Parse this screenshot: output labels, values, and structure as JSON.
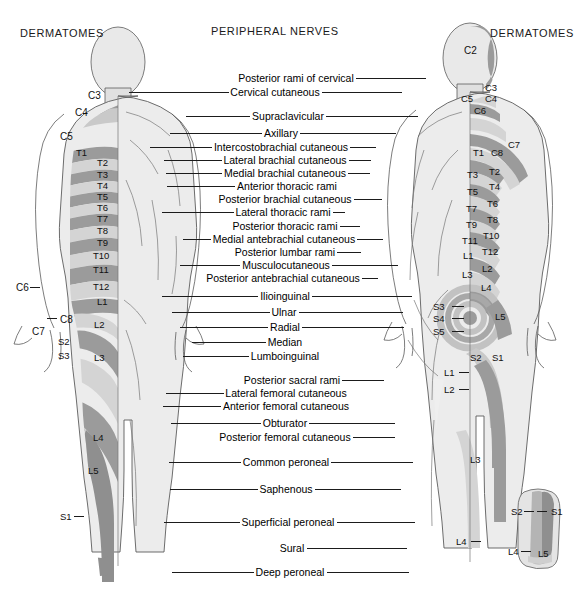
{
  "headers": {
    "left": "DERMATOMES",
    "center": "PERIPHERAL NERVES",
    "right": "DERMATOMES"
  },
  "nerve_labels": [
    {
      "text": "Posterior rami of cervical",
      "x": 296,
      "y": 78,
      "l": 0,
      "r": 70
    },
    {
      "text": "Cervical cutaneous",
      "x": 275,
      "y": 92,
      "l": 100,
      "r": 80
    },
    {
      "text": "Supraclavicular",
      "x": 288,
      "y": 116,
      "l": 64,
      "r": 92
    },
    {
      "text": "Axillary",
      "x": 281,
      "y": 133,
      "l": 92,
      "r": 96
    },
    {
      "text": "Intercostobrachial cutaneous",
      "x": 281,
      "y": 147,
      "l": 62,
      "r": 26
    },
    {
      "text": "Lateral brachial cutaneous",
      "x": 285,
      "y": 160,
      "l": 58,
      "r": 22
    },
    {
      "text": "Medial brachial cutaneous",
      "x": 285,
      "y": 173,
      "l": 56,
      "r": 22
    },
    {
      "text": "Anterior thoracic rami",
      "x": 287,
      "y": 186,
      "l": 68,
      "r": 0
    },
    {
      "text": "Posterior brachial cutaneous",
      "x": 285,
      "y": 199,
      "l": 0,
      "r": 28
    },
    {
      "text": "Lateral thoracic rami",
      "x": 283,
      "y": 212,
      "l": 72,
      "r": 12
    },
    {
      "text": "Posterior thoracic rami",
      "x": 285,
      "y": 226,
      "l": 0,
      "r": 20
    },
    {
      "text": "Medial antebrachial cutaneous",
      "x": 284,
      "y": 239,
      "l": 28,
      "r": 26
    },
    {
      "text": "Posterior lumbar rami",
      "x": 285,
      "y": 252,
      "l": 0,
      "r": 24
    },
    {
      "text": "Musculocutaneous",
      "x": 286,
      "y": 265,
      "l": 60,
      "r": 66
    },
    {
      "text": "Posterior antebrachial cutaneous",
      "x": 283,
      "y": 278,
      "l": 0,
      "r": 16
    },
    {
      "text": "Ilioinguinal",
      "x": 285,
      "y": 296,
      "l": 96,
      "r": 100
    },
    {
      "text": "Ulnar",
      "x": 284,
      "y": 312,
      "l": 98,
      "r": 104
    },
    {
      "text": "Radial",
      "x": 285,
      "y": 327,
      "l": 88,
      "r": 102
    },
    {
      "text": "Median",
      "x": 285,
      "y": 342,
      "l": 74,
      "r": 0
    },
    {
      "text": "Lumboinguinal",
      "x": 285,
      "y": 356,
      "l": 66,
      "r": 0
    },
    {
      "text": "Posterior sacral rami",
      "x": 292,
      "y": 380,
      "l": 0,
      "r": 42
    },
    {
      "text": "Lateral femoral cutaneous",
      "x": 286,
      "y": 393,
      "l": 58,
      "r": 0
    },
    {
      "text": "Anterior femoral cutaneous",
      "x": 286,
      "y": 406,
      "l": 58,
      "r": 0
    },
    {
      "text": "Obturator",
      "x": 285,
      "y": 423,
      "l": 90,
      "r": 86
    },
    {
      "text": "Posterior femoral cutaneous",
      "x": 285,
      "y": 437,
      "l": 0,
      "r": 42
    },
    {
      "text": "Common peroneal",
      "x": 286,
      "y": 462,
      "l": 72,
      "r": 82
    },
    {
      "text": "Saphenous",
      "x": 286,
      "y": 489,
      "l": 88,
      "r": 86
    },
    {
      "text": "Superficial peroneal",
      "x": 288,
      "y": 522,
      "l": 76,
      "r": 78
    },
    {
      "text": "Sural",
      "x": 292,
      "y": 548,
      "l": 0,
      "r": 100
    },
    {
      "text": "Deep peroneal",
      "x": 290,
      "y": 572,
      "l": 82,
      "r": 82
    }
  ],
  "dermatomes_anterior": [
    {
      "text": "C3",
      "x": 88,
      "y": 91,
      "big": true
    },
    {
      "text": "C4",
      "x": 75,
      "y": 108,
      "big": true
    },
    {
      "text": "C5",
      "x": 60,
      "y": 132,
      "big": true
    },
    {
      "text": "T1",
      "x": 76,
      "y": 148
    },
    {
      "text": "T2",
      "x": 97,
      "y": 158
    },
    {
      "text": "T3",
      "x": 97,
      "y": 170
    },
    {
      "text": "T4",
      "x": 97,
      "y": 181
    },
    {
      "text": "T5",
      "x": 97,
      "y": 192
    },
    {
      "text": "T6",
      "x": 97,
      "y": 203
    },
    {
      "text": "T7",
      "x": 97,
      "y": 214
    },
    {
      "text": "T8",
      "x": 97,
      "y": 226
    },
    {
      "text": "T9",
      "x": 97,
      "y": 238
    },
    {
      "text": "T10",
      "x": 93,
      "y": 251
    },
    {
      "text": "T11",
      "x": 93,
      "y": 265
    },
    {
      "text": "T12",
      "x": 93,
      "y": 282
    },
    {
      "text": "C6",
      "x": 16,
      "y": 283,
      "big": true
    },
    {
      "text": "L1",
      "x": 97,
      "y": 297
    },
    {
      "text": "C7",
      "x": 32,
      "y": 327,
      "big": true
    },
    {
      "text": "C8",
      "x": 60,
      "y": 315,
      "big": true
    },
    {
      "text": "L2",
      "x": 94,
      "y": 320
    },
    {
      "text": "S2",
      "x": 58,
      "y": 337
    },
    {
      "text": "S3",
      "x": 58,
      "y": 351
    },
    {
      "text": "L3",
      "x": 94,
      "y": 353
    },
    {
      "text": "L4",
      "x": 93,
      "y": 433
    },
    {
      "text": "L5",
      "x": 88,
      "y": 466
    },
    {
      "text": "S1",
      "x": 60,
      "y": 512
    }
  ],
  "dermatomes_posterior": [
    {
      "text": "C2",
      "x": 464,
      "y": 46,
      "big": true
    },
    {
      "text": "C3",
      "x": 485,
      "y": 83
    },
    {
      "text": "C4",
      "x": 485,
      "y": 94
    },
    {
      "text": "C5",
      "x": 461,
      "y": 94
    },
    {
      "text": "C6",
      "x": 474,
      "y": 106
    },
    {
      "text": "C7",
      "x": 508,
      "y": 140
    },
    {
      "text": "C8",
      "x": 491,
      "y": 148
    },
    {
      "text": "T1",
      "x": 473,
      "y": 148
    },
    {
      "text": "T2",
      "x": 489,
      "y": 167
    },
    {
      "text": "T3",
      "x": 467,
      "y": 170
    },
    {
      "text": "T4",
      "x": 489,
      "y": 182
    },
    {
      "text": "T5",
      "x": 467,
      "y": 187
    },
    {
      "text": "T6",
      "x": 487,
      "y": 199
    },
    {
      "text": "T7",
      "x": 466,
      "y": 204
    },
    {
      "text": "T8",
      "x": 487,
      "y": 215
    },
    {
      "text": "T9",
      "x": 466,
      "y": 220
    },
    {
      "text": "T10",
      "x": 483,
      "y": 231
    },
    {
      "text": "T11",
      "x": 462,
      "y": 236
    },
    {
      "text": "T12",
      "x": 482,
      "y": 247
    },
    {
      "text": "L1",
      "x": 463,
      "y": 251
    },
    {
      "text": "L2",
      "x": 482,
      "y": 264
    },
    {
      "text": "L3",
      "x": 462,
      "y": 270
    },
    {
      "text": "L4",
      "x": 481,
      "y": 283
    },
    {
      "text": "S3",
      "x": 433,
      "y": 302
    },
    {
      "text": "S4",
      "x": 433,
      "y": 314
    },
    {
      "text": "S5",
      "x": 433,
      "y": 327
    },
    {
      "text": "L5",
      "x": 495,
      "y": 312
    },
    {
      "text": "S2",
      "x": 470,
      "y": 353
    },
    {
      "text": "S1",
      "x": 492,
      "y": 353
    },
    {
      "text": "L1",
      "x": 444,
      "y": 368
    },
    {
      "text": "L2",
      "x": 444,
      "y": 385
    },
    {
      "text": "L3",
      "x": 470,
      "y": 455
    },
    {
      "text": "L4",
      "x": 456,
      "y": 537
    },
    {
      "text": "S2",
      "x": 511,
      "y": 507
    },
    {
      "text": "S1",
      "x": 551,
      "y": 507
    },
    {
      "text": "L4",
      "x": 508,
      "y": 547
    },
    {
      "text": "L5",
      "x": 538,
      "y": 549
    }
  ],
  "ticks": [
    {
      "x": 30,
      "y": 287,
      "w": 10
    },
    {
      "x": 47,
      "y": 318,
      "w": 10
    },
    {
      "x": 74,
      "y": 516,
      "w": 10
    },
    {
      "x": 452,
      "y": 306,
      "w": 12
    },
    {
      "x": 452,
      "y": 318,
      "w": 12
    },
    {
      "x": 452,
      "y": 331,
      "w": 12
    },
    {
      "x": 459,
      "y": 372,
      "w": 10
    },
    {
      "x": 459,
      "y": 389,
      "w": 10
    },
    {
      "x": 471,
      "y": 541,
      "w": 10
    },
    {
      "x": 524,
      "y": 511,
      "w": 10
    },
    {
      "x": 537,
      "y": 511,
      "w": 10
    },
    {
      "x": 521,
      "y": 551,
      "w": 10
    }
  ],
  "colors": {
    "background": "#ffffff",
    "body_light": "#e9e9e9",
    "band_light": "#d2d2d2",
    "band_dark": "#9b9b9b",
    "outline": "#5c5c5c",
    "text": "#000000",
    "leader": "#1b1b1b"
  }
}
